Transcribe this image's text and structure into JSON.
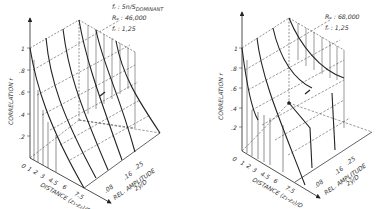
{
  "figure": {
    "type": "pair of 3D surface plots",
    "left_plot": {
      "annotations": [
        "fr = Sn/S DOMINANT",
        "Re = 46,000",
        "fr = 1.25"
      ],
      "annotation_lines": {
        "line1": "fᵣ : Sn/S",
        "line1_sub": "DOMINANT",
        "line2": "Re : 46,000",
        "line3": "fᵣ : 1,25"
      },
      "z_axis_label": "CORRELATION r",
      "z_ticks": [
        "1",
        ".8",
        ".6",
        ".4",
        ".2"
      ],
      "x_axis_label": "DISTANCE (z₁ - z₂)/D",
      "x_ticks": [
        "0",
        "1",
        "2",
        "3",
        "4.5",
        "6",
        "7.5"
      ],
      "y_axis_label": "REL. AMPLITUDE",
      "y_axis_label2": "2ŷ/D",
      "y_ticks": [
        ".08",
        ".16",
        ".25"
      ]
    },
    "right_plot": {
      "annotation_lines": {
        "line2": "Re : 68,000",
        "line3": "fᵣ : 1,25"
      },
      "z_axis_label": "CORRELATION r",
      "z_ticks": [
        "1",
        ".8",
        ".6",
        ".4",
        ".2"
      ],
      "x_axis_label": "DISTANCE (z₁ - z₂)/D",
      "x_ticks": [
        "0",
        "1",
        "2",
        "3",
        "4.5",
        "6",
        "7.5"
      ],
      "y_axis_label": "REL. AMPLITUDE",
      "y_axis_label2": "2ŷ/D",
      "y_ticks": [
        ".08",
        ".16",
        ".25"
      ]
    }
  },
  "labels": {
    "l_ann1": "fᵣ : 5n/S",
    "l_ann1_sub": "DOMINANT",
    "l_ann2": "Rₑ : 46,000",
    "l_ann3": "fᵣ : 1,25",
    "r_ann2": "Rₑ : 68,000",
    "r_ann3": "fᵣ : 1,25",
    "z_label": "CORRELATION r",
    "z1": "1",
    "z08": ".8",
    "z06": ".6",
    "z04": ".4",
    "z02": ".2",
    "x0": "0",
    "x1": "1",
    "x2": "2",
    "x3": "3",
    "x45": "4.5",
    "x6": "6",
    "x75": "7.5",
    "x_label": "DISTANCE (z₁-z₂)/D",
    "y08": ".08",
    "y16": ".16",
    "y25": ".25",
    "y_label": "REL. AMPLITUDE",
    "y_label2": "2ŷ/D"
  }
}
